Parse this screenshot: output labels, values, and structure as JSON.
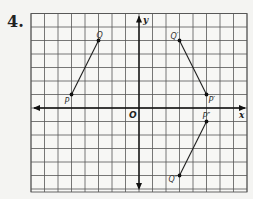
{
  "problem": {
    "number": "4."
  },
  "grid": {
    "x_min": -8,
    "x_max": 8,
    "y_min": -6,
    "y_max": 7,
    "cell_px": 13.5,
    "origin_px": [
      139,
      108
    ],
    "line_color": "#555555",
    "background": "#f7f7f5"
  },
  "axes": {
    "x_label": "x",
    "y_label": "y",
    "origin_label": "O"
  },
  "points": [
    {
      "name": "Q",
      "label": "Q",
      "x": -3,
      "y": 5
    },
    {
      "name": "P",
      "label": "P",
      "x": -5,
      "y": 1
    },
    {
      "name": "Q1",
      "label": "Q′",
      "x": 3,
      "y": 5
    },
    {
      "name": "P1",
      "label": "P′",
      "x": 5,
      "y": 1
    },
    {
      "name": "P2",
      "label": "P″",
      "x": 5,
      "y": -1
    },
    {
      "name": "Q2",
      "label": "Q″",
      "x": 3,
      "y": -5
    }
  ],
  "segments": [
    {
      "name": "PQ",
      "from": "P",
      "to": "Q"
    },
    {
      "name": "P1Q1",
      "from": "P1",
      "to": "Q1"
    },
    {
      "name": "P2Q2",
      "from": "P2",
      "to": "Q2"
    }
  ]
}
